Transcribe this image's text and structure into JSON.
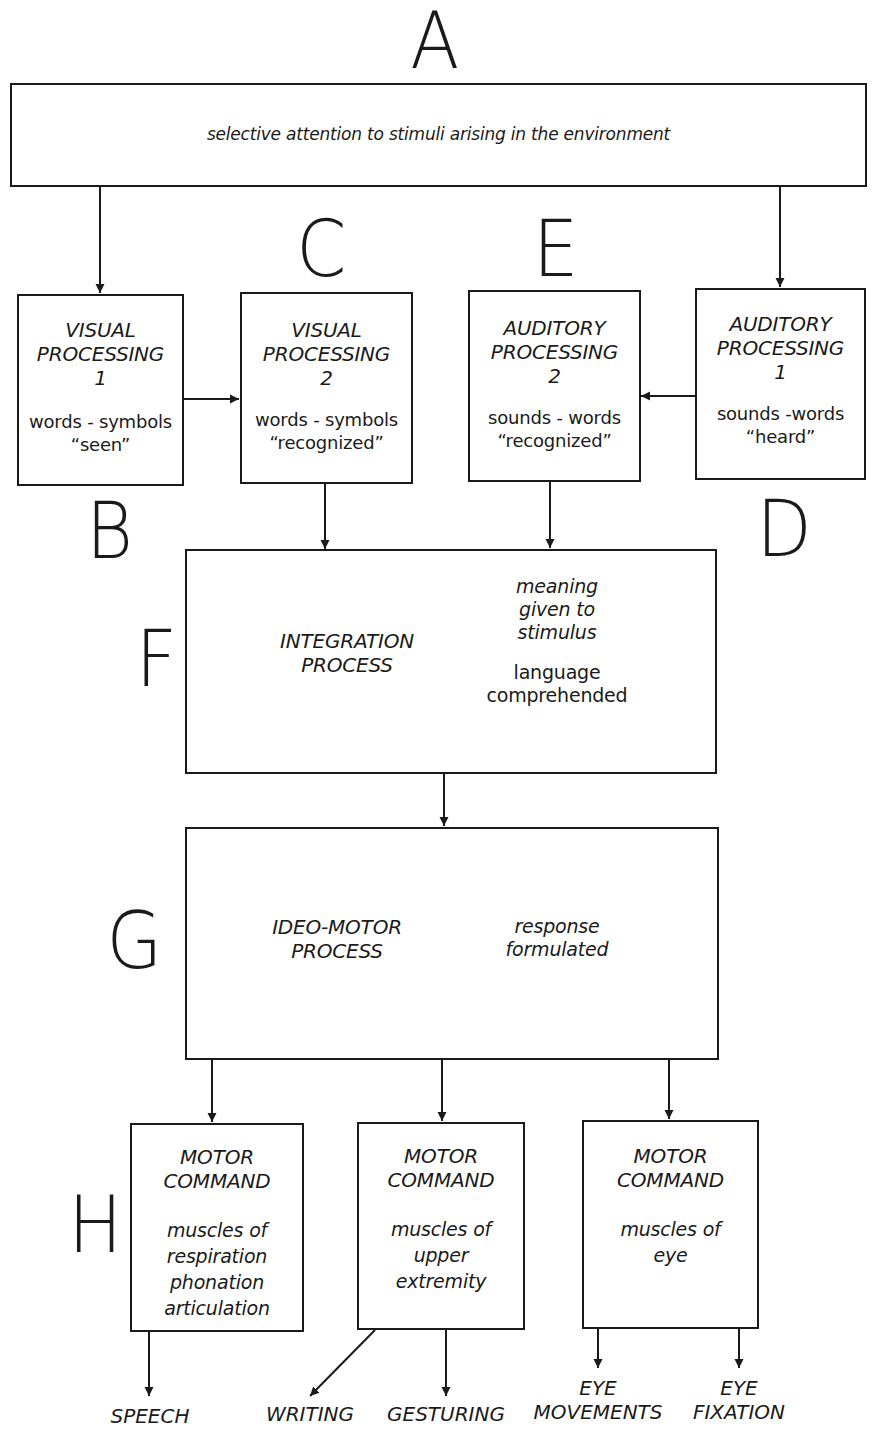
{
  "diagram": {
    "type": "flowchart",
    "stroke_color": "#1a1a1a",
    "background": "#ffffff",
    "nodes": {
      "A": {
        "letter": "A",
        "lines": [
          "selective attention to stimuli arising in the environment"
        ]
      },
      "B": {
        "letter": "B",
        "title": [
          "VISUAL",
          "PROCESSING",
          "1"
        ],
        "desc": [
          "words - symbols",
          "“seen”"
        ]
      },
      "C": {
        "letter": "C",
        "title": [
          "VISUAL",
          "PROCESSING",
          "2"
        ],
        "desc": [
          "words - symbols",
          "“recognized”"
        ]
      },
      "E": {
        "letter": "E",
        "title": [
          "AUDITORY",
          "PROCESSING",
          "2"
        ],
        "desc": [
          "sounds - words",
          "“recognized”"
        ]
      },
      "D": {
        "letter": "D",
        "title": [
          "AUDITORY",
          "PROCESSING",
          "1"
        ],
        "desc": [
          "sounds -words",
          "“heard”"
        ]
      },
      "F": {
        "letter": "F",
        "title": [
          "INTEGRATION",
          "PROCESS"
        ],
        "desc1": [
          "meaning",
          "given to",
          "stimulus"
        ],
        "desc2": [
          "language",
          "comprehended"
        ]
      },
      "G": {
        "letter": "G",
        "title": [
          "IDEO-MOTOR",
          "PROCESS"
        ],
        "desc": [
          "response",
          "formulated"
        ]
      },
      "H": {
        "letter": "H",
        "motor1": {
          "title": [
            "MOTOR",
            "COMMAND"
          ],
          "desc": [
            "muscles of",
            "respiration",
            "phonation",
            "articulation"
          ]
        },
        "motor2": {
          "title": [
            "MOTOR",
            "COMMAND"
          ],
          "desc": [
            "muscles of",
            "upper",
            "extremity"
          ]
        },
        "motor3": {
          "title": [
            "MOTOR",
            "COMMAND"
          ],
          "desc": [
            "muscles of",
            "eye"
          ]
        }
      }
    },
    "outputs": {
      "speech": [
        "SPEECH"
      ],
      "writing": [
        "WRITING"
      ],
      "gesturing": [
        "GESTURING"
      ],
      "eye_movements": [
        "EYE",
        "MOVEMENTS"
      ],
      "eye_fixation": [
        "EYE",
        "FIXATION"
      ]
    },
    "edges": [
      {
        "from": "A",
        "to": "B"
      },
      {
        "from": "A",
        "to": "D"
      },
      {
        "from": "B",
        "to": "C"
      },
      {
        "from": "D",
        "to": "E"
      },
      {
        "from": "C",
        "to": "F"
      },
      {
        "from": "E",
        "to": "F"
      },
      {
        "from": "F",
        "to": "G"
      },
      {
        "from": "G",
        "to": "H.motor1"
      },
      {
        "from": "G",
        "to": "H.motor2"
      },
      {
        "from": "G",
        "to": "H.motor3"
      },
      {
        "from": "H.motor1",
        "to": "SPEECH"
      },
      {
        "from": "H.motor2",
        "to": "WRITING"
      },
      {
        "from": "H.motor2",
        "to": "GESTURING"
      },
      {
        "from": "H.motor3",
        "to": "EYE MOVEMENTS"
      },
      {
        "from": "H.motor3",
        "to": "EYE FIXATION"
      }
    ]
  }
}
